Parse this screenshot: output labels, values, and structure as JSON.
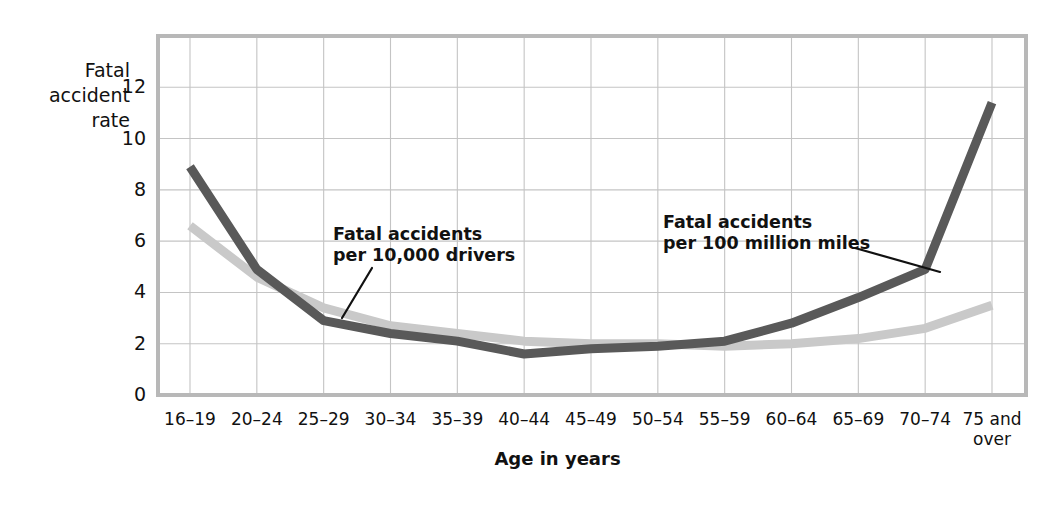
{
  "chart_data": {
    "type": "line",
    "title": "",
    "xlabel": "Age in years",
    "ylabel": "Fatal\naccident\nrate",
    "categories": [
      "16–19",
      "20–24",
      "25–29",
      "30–34",
      "35–39",
      "40–44",
      "45–49",
      "50–54",
      "55–59",
      "60–64",
      "65–69",
      "70–74",
      "75 and\nover"
    ],
    "ylim": [
      0,
      14
    ],
    "yticks": [
      0,
      2,
      4,
      6,
      8,
      10,
      12
    ],
    "ytick_labels": [
      "0",
      "2",
      "4",
      "6",
      "8",
      "10",
      "12"
    ],
    "grid": true,
    "legend_position": "inline-annotations",
    "series": [
      {
        "name": "Fatal accidents\nper 100 million miles",
        "color": "#595959",
        "values": [
          8.9,
          4.9,
          2.9,
          2.4,
          2.1,
          1.6,
          1.8,
          1.9,
          2.1,
          2.8,
          3.8,
          4.9,
          11.4
        ]
      },
      {
        "name": "Fatal accidents\nper 10,000 drivers",
        "color": "#c9c9c9",
        "values": [
          6.6,
          4.6,
          3.4,
          2.7,
          2.4,
          2.1,
          2.0,
          2.0,
          1.9,
          2.0,
          2.2,
          2.6,
          3.5
        ]
      }
    ],
    "annotations": [
      {
        "text": "Fatal accidents\nper 10,000 drivers",
        "target_series": 1,
        "target_category": "25–29"
      },
      {
        "text": "Fatal accidents\nper 100 million miles",
        "target_series": 0,
        "target_category": "70–74"
      }
    ]
  },
  "colors": {
    "miles_line": "#595959",
    "drivers_line": "#c9c9c9",
    "grid": "#c4c4c4",
    "axis": "#b8b8b8",
    "text": "#111111",
    "background": "#ffffff"
  }
}
